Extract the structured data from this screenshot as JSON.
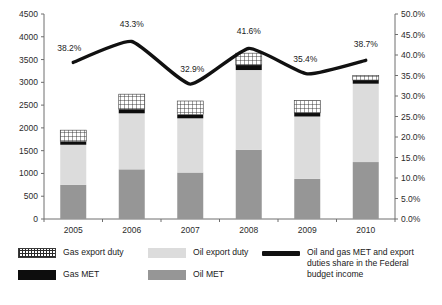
{
  "chart_data": {
    "type": "bar",
    "subtype": "stacked-bar-with-line",
    "title": "",
    "xlabel": "",
    "ylabel": "",
    "categories": [
      "2005",
      "2006",
      "2007",
      "2008",
      "2009",
      "2010"
    ],
    "series": [
      {
        "name": "Oil MET",
        "axis": "left",
        "color": "#969696",
        "values": [
          750,
          1090,
          1020,
          1520,
          880,
          1250
        ]
      },
      {
        "name": "Oil export duty",
        "axis": "left",
        "color": "#dcdcdc",
        "values": [
          880,
          1230,
          1190,
          1750,
          1370,
          1720
        ]
      },
      {
        "name": "Gas MET",
        "axis": "left",
        "color": "#0d0d0d",
        "values": [
          70,
          90,
          80,
          110,
          80,
          80
        ]
      },
      {
        "name": "Gas export duty",
        "axis": "left",
        "color": "#ffffff",
        "values": [
          250,
          330,
          300,
          260,
          270,
          100
        ]
      },
      {
        "name": "Oil and gas MET and export duties share in the Federal budget income",
        "axis": "right",
        "type": "line",
        "color": "#111111",
        "values": [
          38.2,
          43.3,
          32.9,
          41.6,
          35.4,
          38.7
        ],
        "labels": [
          "38.2%",
          "43.3%",
          "32.9%",
          "41.6%",
          "35.4%",
          "38.7%"
        ]
      }
    ],
    "left_axis": {
      "min": 0,
      "max": 4500,
      "step": 500,
      "ticks": [
        "0",
        "500",
        "1000",
        "1500",
        "2000",
        "2500",
        "3000",
        "3500",
        "4000",
        "4500"
      ]
    },
    "right_axis": {
      "min": 0,
      "max": 50,
      "step": 5,
      "ticks": [
        "0.0%",
        "5.0%",
        "10.0%",
        "15.0%",
        "20.0%",
        "25.0%",
        "30.0%",
        "35.0%",
        "40.0%",
        "45.0%",
        "50.0%"
      ]
    },
    "grid": false,
    "legend_position": "bottom"
  },
  "legend": {
    "gas_export_duty": "Gas export duty",
    "gas_met": "Gas MET",
    "oil_export_duty": "Oil export duty",
    "oil_met": "Oil MET",
    "share_line": "Oil and gas MET and export\nduties share in the Federal\nbudget income"
  }
}
